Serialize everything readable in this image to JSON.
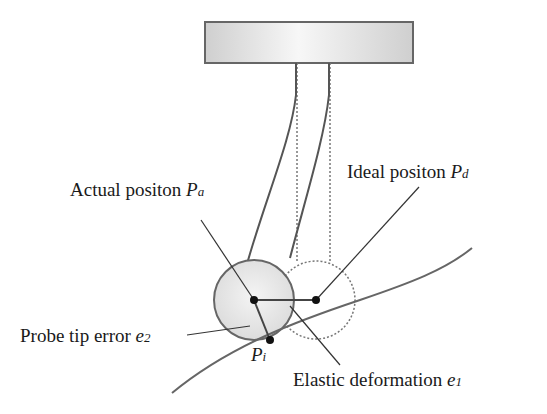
{
  "diagram": {
    "type": "probe-deflection-schematic",
    "labels": {
      "actual_position": {
        "text": "Actual positon ",
        "symbol": "P",
        "subscript": "a"
      },
      "ideal_position": {
        "text": "Ideal positon ",
        "symbol": "P",
        "subscript": "d"
      },
      "probe_tip_error": {
        "text": "Probe tip error ",
        "symbol": "e",
        "subscript": "2"
      },
      "contact_point": {
        "symbol": "P",
        "subscript": "i"
      },
      "elastic_deformation": {
        "text": "Elastic deformation ",
        "symbol": "e",
        "subscript": "1"
      }
    },
    "colors": {
      "stroke": "#555555",
      "fill_actual": "#e6e6e6",
      "holder_fill": "#d8d8d8",
      "point": "#111111"
    }
  }
}
